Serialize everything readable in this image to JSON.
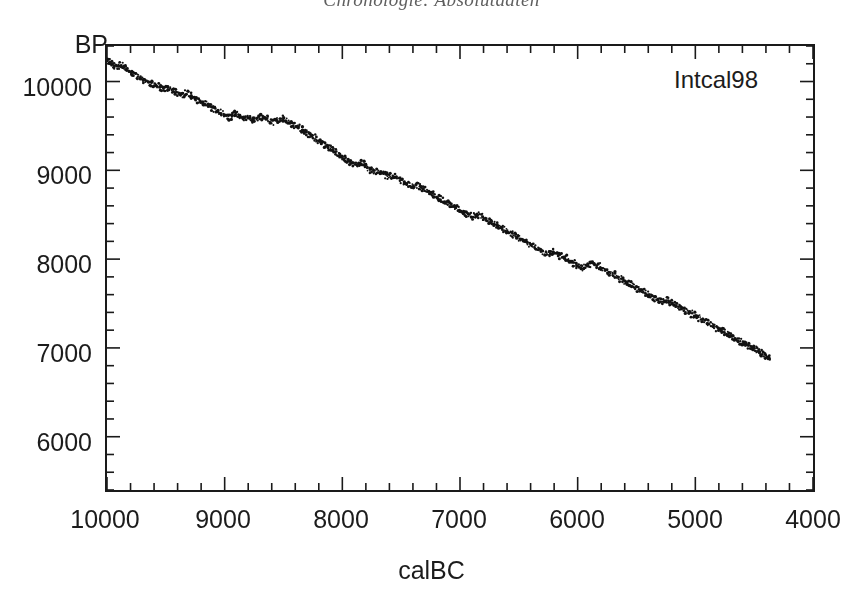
{
  "page": {
    "running_head": "Chronologie: Absolutdaten"
  },
  "figure": {
    "series_annotation": "Intcal98",
    "y_axis_title": "BP",
    "x_axis_title": "calBC"
  },
  "chart_data": {
    "type": "scatter",
    "title": "",
    "subtitle": "",
    "annotations": [
      "Intcal98"
    ],
    "xlabel": "calBC",
    "ylabel": "BP",
    "xlim": [
      10000,
      4000
    ],
    "ylim": [
      5400,
      10400
    ],
    "x_reversed": true,
    "grid": false,
    "legend": null,
    "x_ticks_major": [
      10000,
      9000,
      8000,
      7000,
      6000,
      5000,
      4000
    ],
    "x_tick_labels": [
      "10000",
      "9000",
      "8000",
      "7000",
      "6000",
      "5000",
      "4000"
    ],
    "x_tick_minor_step": 200,
    "y_ticks_major": [
      10000,
      9000,
      8000,
      7000,
      6000
    ],
    "y_tick_labels": [
      "10000",
      "9000",
      "8000",
      "7000",
      "6000"
    ],
    "y_tick_minor_step": 200,
    "marker": "dot",
    "series": [
      {
        "name": "Intcal98",
        "x": [
          10000,
          9960,
          9920,
          9880,
          9840,
          9800,
          9760,
          9720,
          9680,
          9640,
          9600,
          9560,
          9520,
          9480,
          9440,
          9400,
          9360,
          9320,
          9280,
          9240,
          9200,
          9160,
          9120,
          9080,
          9040,
          9000,
          8960,
          8920,
          8880,
          8840,
          8800,
          8760,
          8720,
          8680,
          8640,
          8600,
          8560,
          8520,
          8480,
          8440,
          8400,
          8360,
          8320,
          8280,
          8240,
          8200,
          8160,
          8120,
          8080,
          8040,
          8000,
          7960,
          7920,
          7880,
          7840,
          7800,
          7760,
          7720,
          7680,
          7640,
          7600,
          7560,
          7520,
          7480,
          7440,
          7400,
          7360,
          7320,
          7280,
          7240,
          7200,
          7160,
          7120,
          7080,
          7040,
          7000,
          6960,
          6920,
          6880,
          6840,
          6800,
          6760,
          6720,
          6680,
          6640,
          6600,
          6560,
          6520,
          6480,
          6440,
          6400,
          6360,
          6320,
          6280,
          6240,
          6200,
          6160,
          6120,
          6080,
          6040,
          6000,
          5960,
          5920,
          5880,
          5840,
          5800,
          5760,
          5720,
          5680,
          5640,
          5600,
          5560,
          5520,
          5480,
          5440,
          5400,
          5360,
          5320,
          5280,
          5240,
          5200,
          5160,
          5120,
          5080,
          5040,
          5000,
          4960,
          4920,
          4880,
          4840,
          4800,
          4760,
          4720,
          4680,
          4640,
          4600,
          4560,
          4520,
          4480,
          4440,
          4400,
          4360
        ],
        "y": [
          10250,
          10205,
          10160,
          10190,
          10140,
          10100,
          10080,
          10040,
          10010,
          9990,
          9965,
          9940,
          9915,
          9935,
          9900,
          9870,
          9850,
          9860,
          9830,
          9800,
          9775,
          9745,
          9715,
          9685,
          9650,
          9620,
          9600,
          9640,
          9615,
          9580,
          9600,
          9565,
          9590,
          9610,
          9575,
          9545,
          9560,
          9585,
          9560,
          9530,
          9500,
          9470,
          9440,
          9405,
          9370,
          9335,
          9300,
          9265,
          9230,
          9190,
          9150,
          9110,
          9075,
          9060,
          9080,
          9045,
          9010,
          8975,
          8985,
          8955,
          8925,
          8940,
          8905,
          8870,
          8840,
          8810,
          8835,
          8800,
          8770,
          8740,
          8705,
          8670,
          8640,
          8610,
          8580,
          8550,
          8520,
          8495,
          8470,
          8500,
          8465,
          8435,
          8405,
          8375,
          8345,
          8315,
          8285,
          8255,
          8225,
          8195,
          8165,
          8135,
          8105,
          8075,
          8055,
          8080,
          8050,
          8020,
          7990,
          7960,
          7930,
          7900,
          7930,
          7960,
          7930,
          7900,
          7870,
          7840,
          7810,
          7780,
          7750,
          7720,
          7690,
          7660,
          7630,
          7600,
          7570,
          7545,
          7520,
          7540,
          7510,
          7480,
          7450,
          7420,
          7390,
          7360,
          7330,
          7300,
          7270,
          7240,
          7210,
          7180,
          7150,
          7120,
          7090,
          7060,
          7030,
          7000,
          6970,
          6940,
          6910,
          6880
        ]
      }
    ]
  }
}
